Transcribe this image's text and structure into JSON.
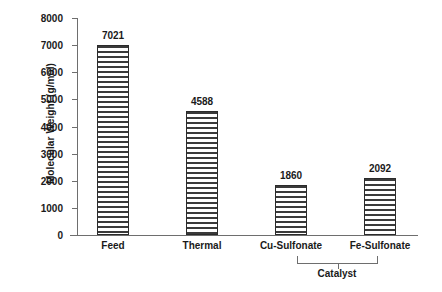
{
  "chart_data": {
    "type": "bar",
    "title": "",
    "xlabel": "",
    "ylabel": "Molecular Weight (g/mol)",
    "categories": [
      "Feed",
      "Thermal",
      "Cu-Sulfonate",
      "Fe-Sulfonate"
    ],
    "values": [
      7021,
      4588,
      1860,
      2092
    ],
    "value_labels": [
      "7021",
      "4588",
      "1860",
      "2092"
    ],
    "ylim": [
      0,
      8000
    ],
    "ytick_values": [
      0,
      1000,
      2000,
      3000,
      4000,
      5000,
      6000,
      7000,
      8000
    ],
    "ytick_labels": [
      "0",
      "1000",
      "2000",
      "3000",
      "4000",
      "5000",
      "6000",
      "7000",
      "8000"
    ],
    "grid": false,
    "legend": false,
    "legend_position": "none",
    "bar_fill": "horizontal-hatch",
    "annotations": [
      {
        "text": "Catalyst",
        "type": "group-bracket",
        "spans": [
          "Cu-Sulfonate",
          "Fe-Sulfonate"
        ]
      }
    ],
    "colors": {
      "bar_edge": "#2b2b2b",
      "bar_hatch": "#3a3a3a",
      "bar_background": "#ffffff",
      "axis": "#6e6e6e",
      "text": "#1a1a1a",
      "plot_background": "#ffffff"
    }
  }
}
